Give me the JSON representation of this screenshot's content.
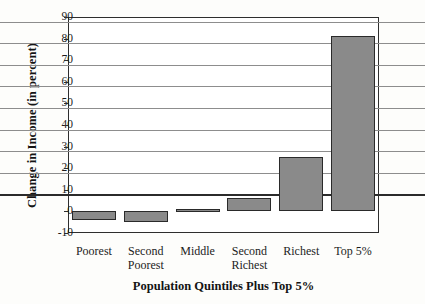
{
  "chart_data": {
    "type": "bar",
    "title": "",
    "xlabel": "Population Quintiles Plus Top 5%",
    "ylabel": "Change in Income (in percent)",
    "categories": [
      "Poorest",
      "Second Poorest",
      "Middle",
      "Second Richest",
      "Richest",
      "Top 5%"
    ],
    "category_lines": [
      [
        "Poorest"
      ],
      [
        "Second",
        "Poorest"
      ],
      [
        "Middle"
      ],
      [
        "Second",
        "Richest"
      ],
      [
        "Richest"
      ],
      [
        "Top 5%"
      ]
    ],
    "values": [
      -4,
      -5,
      1,
      6,
      25,
      81
    ],
    "ylim": [
      -10,
      90
    ],
    "ytick_values": [
      90,
      80,
      70,
      60,
      50,
      40,
      30,
      20,
      10,
      0,
      -10
    ],
    "ytick_labels": [
      "90",
      "80",
      "70",
      "60",
      "50",
      "40",
      "30",
      "20",
      "10",
      "0",
      "-10"
    ],
    "ystep": 10,
    "grid": "horizontal",
    "legend": "none",
    "bar_fill_color": "#8a8a8a",
    "bar_edge_color": "#2a2a2a",
    "gridline_color": "#8d8d8d",
    "axis_color": "#2e2e2e",
    "background_color": "#fdfdfb",
    "plot_background_color": "#ffffff"
  }
}
